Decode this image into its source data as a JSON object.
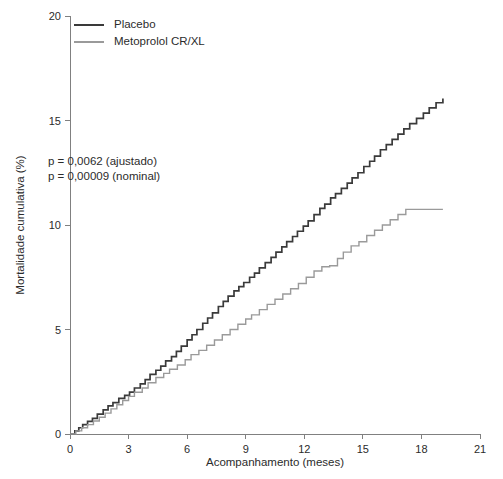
{
  "chart_data": {
    "type": "line",
    "subtype": "kaplan-meier-cumulative-mortality",
    "title": "",
    "xlabel": "Acompanhamento (meses)",
    "ylabel": "Mortalidade cumulativa (%)",
    "xlim": [
      0,
      21
    ],
    "ylim": [
      0,
      20
    ],
    "xticks": [
      0,
      3,
      6,
      9,
      12,
      15,
      18,
      21
    ],
    "xticklabels": [
      "0",
      "3",
      "6",
      "9",
      "12",
      "15",
      "18",
      "21"
    ],
    "yticks": [
      0,
      5,
      10,
      15,
      20
    ],
    "yticklabels": [
      "0",
      "5",
      "10",
      "15",
      "20"
    ],
    "grid": false,
    "legend_position": "top-left",
    "annotations": [
      "p = 0,0062 (ajustado)",
      "p = 0,00009 (nominal)"
    ],
    "series": [
      {
        "name": "Placebo",
        "color": "#3a3a3a",
        "linewidth": 1.7,
        "step": "post",
        "x": [
          0.0,
          0.25,
          0.45,
          0.65,
          0.9,
          1.15,
          1.4,
          1.7,
          1.95,
          2.2,
          2.5,
          2.8,
          3.05,
          3.3,
          3.6,
          3.85,
          4.1,
          4.4,
          4.65,
          4.9,
          5.2,
          5.45,
          5.7,
          6.0,
          6.25,
          6.5,
          6.8,
          7.05,
          7.3,
          7.6,
          7.85,
          8.1,
          8.4,
          8.65,
          8.9,
          9.2,
          9.45,
          9.7,
          10.0,
          10.3,
          10.55,
          10.85,
          11.1,
          11.4,
          11.65,
          11.95,
          12.2,
          12.5,
          12.8,
          13.05,
          13.35,
          13.6,
          13.9,
          14.2,
          14.45,
          14.75,
          15.05,
          15.35,
          15.6,
          15.9,
          16.2,
          16.5,
          16.8,
          17.1,
          17.4,
          17.75,
          18.1,
          18.4,
          18.75,
          19.1
        ],
        "y": [
          0.0,
          0.15,
          0.3,
          0.45,
          0.6,
          0.75,
          0.95,
          1.15,
          1.35,
          1.5,
          1.7,
          1.85,
          2.0,
          2.2,
          2.4,
          2.6,
          2.85,
          3.05,
          3.25,
          3.5,
          3.7,
          3.95,
          4.2,
          4.5,
          4.75,
          5.0,
          5.3,
          5.55,
          5.8,
          6.1,
          6.35,
          6.6,
          6.85,
          7.05,
          7.25,
          7.5,
          7.7,
          7.95,
          8.2,
          8.45,
          8.7,
          8.95,
          9.2,
          9.45,
          9.7,
          9.95,
          10.2,
          10.5,
          10.8,
          11.0,
          11.3,
          11.5,
          11.75,
          12.0,
          12.25,
          12.5,
          12.8,
          13.05,
          13.3,
          13.6,
          13.85,
          14.1,
          14.35,
          14.6,
          14.85,
          15.1,
          15.35,
          15.6,
          15.85,
          16.05
        ]
      },
      {
        "name": "Metoprolol CR/XL",
        "color": "#9a9a9a",
        "linewidth": 1.4,
        "step": "post",
        "x": [
          0.0,
          0.3,
          0.6,
          0.9,
          1.2,
          1.5,
          1.8,
          2.1,
          2.4,
          2.7,
          3.0,
          3.3,
          3.7,
          4.0,
          4.4,
          4.8,
          5.1,
          5.5,
          5.9,
          6.2,
          6.6,
          7.0,
          7.4,
          7.8,
          8.2,
          8.6,
          9.0,
          9.3,
          9.7,
          10.1,
          10.5,
          10.9,
          11.3,
          11.7,
          12.1,
          12.5,
          12.9,
          13.3,
          13.7,
          14.0,
          14.4,
          14.8,
          15.2,
          15.6,
          16.0,
          16.4,
          16.8,
          17.2,
          19.1
        ],
        "y": [
          0.0,
          0.15,
          0.3,
          0.45,
          0.62,
          0.8,
          1.0,
          1.2,
          1.4,
          1.6,
          1.8,
          2.0,
          2.2,
          2.45,
          2.7,
          2.9,
          3.1,
          3.3,
          3.55,
          3.8,
          4.0,
          4.25,
          4.5,
          4.75,
          5.0,
          5.25,
          5.5,
          5.7,
          5.95,
          6.2,
          6.45,
          6.7,
          6.95,
          7.2,
          7.5,
          7.8,
          8.0,
          8.05,
          8.4,
          8.7,
          9.0,
          9.2,
          9.5,
          9.75,
          10.0,
          10.25,
          10.5,
          10.75,
          10.75
        ]
      }
    ]
  },
  "legend": {
    "items": [
      {
        "label": "Placebo"
      },
      {
        "label": "Metoprolol CR/XL"
      }
    ]
  }
}
